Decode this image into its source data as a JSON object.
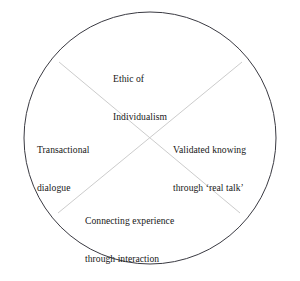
{
  "diagram": {
    "type": "circle-quadrants",
    "shape_name": "circle",
    "background_color": "#ffffff",
    "circle": {
      "stroke_color": "#3a3a42",
      "fill_color": "#ffffff",
      "center_x": 150,
      "center_y": 138,
      "radius": 126,
      "stroke_width": 1
    },
    "dividers": {
      "stroke_color": "#cccccc",
      "stroke_width": 1,
      "lines": [
        {
          "name": "diagonal-nw-se",
          "x1": 59,
          "y1": 62,
          "x2": 240,
          "y2": 213
        },
        {
          "name": "diagonal-ne-sw",
          "x1": 242,
          "y1": 62,
          "x2": 58,
          "y2": 213
        }
      ]
    },
    "quadrants": [
      {
        "id": "top",
        "position": "top",
        "lines": [
          "Ethic of",
          "Individualism"
        ]
      },
      {
        "id": "left",
        "position": "left",
        "lines": [
          "Transactional",
          "dialogue"
        ]
      },
      {
        "id": "right",
        "position": "right",
        "lines": [
          "Validated knowing",
          "through ‘real talk’"
        ]
      },
      {
        "id": "bottom",
        "position": "bottom",
        "lines": [
          "Connecting experience",
          "through interaction"
        ]
      }
    ]
  }
}
